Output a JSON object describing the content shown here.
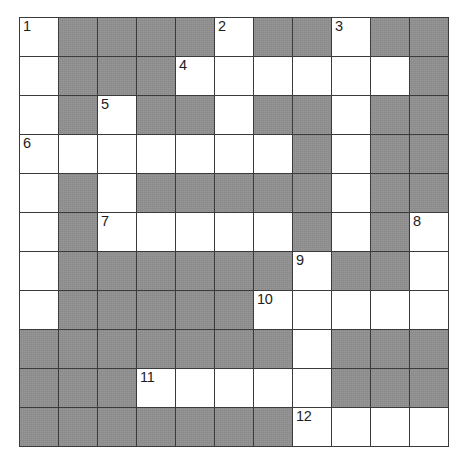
{
  "puzzle": {
    "kind": "crossword-grid",
    "rows": 11,
    "cols": 11,
    "cell_size_px": 39,
    "colors": {
      "open_cell": "#ffffff",
      "blocked_cell": "#8f8f8f",
      "grid_line": "#3b3b3b",
      "number_text": "#1d1d1d",
      "page_background": "#ffffff"
    },
    "legend": {
      "open": 1,
      "blocked": 0
    },
    "grid": [
      [
        1,
        0,
        0,
        0,
        0,
        1,
        0,
        0,
        1,
        0,
        0
      ],
      [
        1,
        0,
        0,
        0,
        1,
        1,
        1,
        1,
        1,
        1,
        0
      ],
      [
        1,
        0,
        1,
        0,
        0,
        1,
        0,
        0,
        1,
        0,
        0
      ],
      [
        1,
        1,
        1,
        1,
        1,
        1,
        1,
        0,
        1,
        0,
        0
      ],
      [
        1,
        0,
        1,
        0,
        0,
        0,
        0,
        0,
        1,
        0,
        0
      ],
      [
        1,
        0,
        1,
        1,
        1,
        1,
        1,
        0,
        1,
        0,
        1
      ],
      [
        1,
        0,
        0,
        0,
        0,
        0,
        0,
        1,
        0,
        0,
        1
      ],
      [
        1,
        0,
        0,
        0,
        0,
        0,
        1,
        1,
        1,
        1,
        1
      ],
      [
        0,
        0,
        0,
        0,
        0,
        0,
        0,
        1,
        0,
        0,
        0
      ],
      [
        0,
        0,
        0,
        1,
        1,
        1,
        1,
        1,
        0,
        0,
        0
      ],
      [
        0,
        0,
        0,
        0,
        0,
        0,
        0,
        1,
        1,
        1,
        1
      ]
    ],
    "numbers": [
      {
        "label": "1",
        "row": 1,
        "col": 1
      },
      {
        "label": "2",
        "row": 1,
        "col": 6
      },
      {
        "label": "3",
        "row": 1,
        "col": 9
      },
      {
        "label": "4",
        "row": 2,
        "col": 5
      },
      {
        "label": "5",
        "row": 3,
        "col": 3
      },
      {
        "label": "6",
        "row": 4,
        "col": 1
      },
      {
        "label": "7",
        "row": 6,
        "col": 3
      },
      {
        "label": "8",
        "row": 6,
        "col": 11
      },
      {
        "label": "9",
        "row": 7,
        "col": 8
      },
      {
        "label": "10",
        "row": 8,
        "col": 7
      },
      {
        "label": "11",
        "row": 10,
        "col": 4
      },
      {
        "label": "12",
        "row": 11,
        "col": 8
      }
    ]
  }
}
